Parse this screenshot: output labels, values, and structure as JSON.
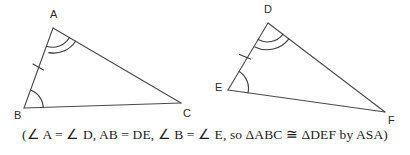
{
  "figure": {
    "type": "geometry-diagram",
    "background_color": "#ffffff",
    "stroke_color": "#4a4a4a",
    "label_color": "#2b2b2b",
    "triangles": [
      {
        "name": "triangle-abc",
        "vertices": [
          {
            "label": "A",
            "x": 53,
            "y": 28,
            "label_x": 50,
            "label_y": 18
          },
          {
            "label": "B",
            "x": 24,
            "y": 108,
            "label_x": 14,
            "label_y": 119
          },
          {
            "label": "C",
            "x": 181,
            "y": 103,
            "label_x": 183,
            "label_y": 117
          }
        ],
        "angle_marks": [
          {
            "at": "A",
            "arcs": 2
          },
          {
            "at": "B",
            "arcs": 1
          }
        ],
        "side_ticks": [
          {
            "side": "AB",
            "ticks": 1
          }
        ]
      },
      {
        "name": "triangle-def",
        "vertices": [
          {
            "label": "D",
            "x": 268,
            "y": 23,
            "label_x": 264,
            "label_y": 13
          },
          {
            "label": "E",
            "x": 228,
            "y": 90,
            "label_x": 215,
            "label_y": 91
          },
          {
            "label": "F",
            "x": 385,
            "y": 112,
            "label_x": 388,
            "label_y": 124
          }
        ],
        "angle_marks": [
          {
            "at": "D",
            "arcs": 2
          },
          {
            "at": "E",
            "arcs": 1
          }
        ],
        "side_ticks": [
          {
            "side": "DE",
            "ticks": 1
          }
        ]
      }
    ]
  },
  "caption": {
    "text": "(∠ A = ∠ D, AB = DE, ∠ B = ∠ E, so ΔABC ≅ ΔDEF by ASA)"
  }
}
